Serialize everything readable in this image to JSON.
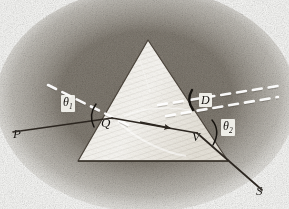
{
  "figure": {
    "domain": "engraving-diagram",
    "medium": "antique halftone engraving",
    "canvas": {
      "width": 289,
      "height": 209
    },
    "palette": {
      "paper": "#fbfbf9",
      "ink": "#16130f",
      "prism_fill": "#efece4",
      "prism_edge": "#4a433a",
      "ray": "#2c2620",
      "normal_dash": "#ffffff",
      "vignette": "#5d564c"
    }
  },
  "prism": {
    "name": "triangular-prism",
    "apex": {
      "x": 148,
      "y": 40
    },
    "base_left": {
      "x": 78,
      "y": 161
    },
    "base_right": {
      "x": 228,
      "y": 161
    },
    "fill": "#efece4",
    "stroke": "#4a433a"
  },
  "rays": {
    "incident": {
      "name": "incident-ray",
      "from": {
        "x": 13,
        "y": 132
      },
      "to": {
        "x": 112,
        "y": 118
      },
      "color": "#2c2620"
    },
    "internal": {
      "name": "internal-refracted-ray",
      "from": {
        "x": 112,
        "y": 118
      },
      "to": {
        "x": 197,
        "y": 133
      },
      "color": "#2c2620",
      "arrow_at": {
        "x": 162,
        "y": 127
      }
    },
    "emergent": {
      "name": "emergent-ray",
      "from": {
        "x": 197,
        "y": 133
      },
      "to": {
        "x": 262,
        "y": 190
      },
      "color": "#2c2620"
    }
  },
  "normals": [
    {
      "name": "normal-at-entry",
      "from": {
        "x": 48,
        "y": 85
      },
      "to": {
        "x": 128,
        "y": 125
      },
      "style": "dashed-white"
    },
    {
      "name": "normal-at-exit",
      "from": {
        "x": 166,
        "y": 116
      },
      "to": {
        "x": 276,
        "y": 98
      },
      "style": "dashed-white"
    },
    {
      "name": "extended-incident-ray",
      "from": {
        "x": 160,
        "y": 104
      },
      "to": {
        "x": 282,
        "y": 86
      },
      "style": "dashed-white"
    }
  ],
  "labels": {
    "p": {
      "text": "P",
      "x": 13,
      "y": 127,
      "size": 13,
      "boxed": false
    },
    "q": {
      "text": "Q",
      "x": 101,
      "y": 118,
      "size": 13,
      "boxed": false
    },
    "v": {
      "text": "V",
      "x": 192,
      "y": 131,
      "size": 13,
      "boxed": false
    },
    "s": {
      "text": "S",
      "x": 255,
      "y": 184,
      "size": 13,
      "boxed": false
    },
    "d": {
      "text": "D",
      "x": 199,
      "y": 94,
      "size": 12,
      "boxed": true
    },
    "theta1": {
      "symbol": "θ",
      "sub": "1",
      "x": 61,
      "y": 96,
      "size": 12,
      "boxed": true
    },
    "theta2": {
      "symbol": "θ",
      "sub": "2",
      "x": 221,
      "y": 120,
      "size": 12,
      "boxed": true
    }
  },
  "angle_arcs": [
    {
      "name": "angle-arc-theta1",
      "cx": 112,
      "cy": 118,
      "r": 20,
      "start_deg": 200,
      "end_deg": 243
    },
    {
      "name": "angle-arc-theta2",
      "cx": 197,
      "cy": 133,
      "r": 22,
      "start_deg": -18,
      "end_deg": 38
    },
    {
      "name": "angle-arc-deviation-d",
      "cx": 197,
      "cy": 133,
      "r": 40,
      "start_deg": -20,
      "end_deg": -5
    }
  ]
}
